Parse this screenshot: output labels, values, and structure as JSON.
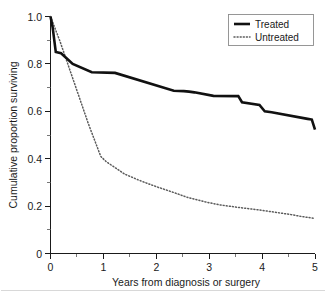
{
  "chart_data": {
    "type": "line",
    "title": "",
    "subtitle": "",
    "xlabel": "Years from diagnosis or surgery",
    "ylabel": "Cumulative proportion surviving",
    "xlim": [
      0,
      5
    ],
    "ylim": [
      0,
      1.0
    ],
    "xticks": [
      0,
      1,
      2,
      3,
      4,
      5
    ],
    "xtick_labels": [
      "0",
      "1",
      "2",
      "3",
      "4",
      "5"
    ],
    "xticks_minor": [
      0.5,
      1.5,
      2.5,
      3.5,
      4.5
    ],
    "yticks": [
      0,
      0.2,
      0.4,
      0.6,
      0.8,
      1.0
    ],
    "ytick_labels": [
      "0",
      "0.2",
      "0.4",
      "0.6",
      "0.8",
      "1.0"
    ],
    "yticks_minor": [
      0.1,
      0.3,
      0.5,
      0.7,
      0.9
    ],
    "grid": false,
    "legend_position": "top-right",
    "annotations": [],
    "series": [
      {
        "name": "Treated",
        "style": "solid",
        "color": "#111111",
        "points": [
          [
            0.0,
            1.0
          ],
          [
            0.04,
            0.955
          ],
          [
            0.1,
            0.85
          ],
          [
            0.2,
            0.845
          ],
          [
            0.42,
            0.8
          ],
          [
            0.78,
            0.765
          ],
          [
            1.22,
            0.762
          ],
          [
            2.33,
            0.687
          ],
          [
            2.52,
            0.685
          ],
          [
            2.62,
            0.683
          ],
          [
            2.72,
            0.68
          ],
          [
            3.08,
            0.665
          ],
          [
            3.55,
            0.664
          ],
          [
            3.62,
            0.638
          ],
          [
            3.95,
            0.627
          ],
          [
            4.05,
            0.6
          ],
          [
            4.18,
            0.596
          ],
          [
            4.86,
            0.568
          ],
          [
            4.94,
            0.565
          ],
          [
            5.0,
            0.523
          ]
        ]
      },
      {
        "name": "Untreated",
        "style": "dotted",
        "color": "#5b5b5b",
        "points": [
          [
            0.0,
            1.0
          ],
          [
            0.18,
            0.895
          ],
          [
            0.45,
            0.72
          ],
          [
            0.72,
            0.545
          ],
          [
            0.95,
            0.41
          ],
          [
            1.05,
            0.388
          ],
          [
            1.4,
            0.335
          ],
          [
            1.72,
            0.305
          ],
          [
            2.0,
            0.282
          ],
          [
            2.32,
            0.258
          ],
          [
            2.6,
            0.236
          ],
          [
            2.92,
            0.218
          ],
          [
            3.2,
            0.205
          ],
          [
            3.5,
            0.196
          ],
          [
            3.72,
            0.19
          ],
          [
            4.0,
            0.182
          ],
          [
            4.25,
            0.174
          ],
          [
            4.55,
            0.164
          ],
          [
            4.75,
            0.156
          ],
          [
            5.0,
            0.148
          ]
        ]
      }
    ]
  },
  "legend": {
    "entries": [
      {
        "label": "Treated",
        "style": "solid"
      },
      {
        "label": "Untreated",
        "style": "dotted"
      }
    ]
  },
  "axes": {
    "x_title": "Years from diagnosis or surgery",
    "y_title": "Cumulative proportion surviving",
    "x_labels": [
      "0",
      "1",
      "2",
      "3",
      "4",
      "5"
    ],
    "y_labels": [
      "0",
      "0.2",
      "0.4",
      "0.6",
      "0.8",
      "1.0"
    ]
  }
}
